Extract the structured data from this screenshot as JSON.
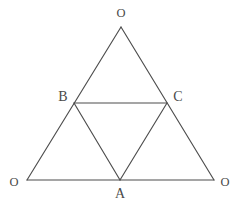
{
  "figure": {
    "background_color": "#ffffff",
    "line_color": "#4d4d4d",
    "label_color": "#4a4a4a",
    "width": 239,
    "height": 209,
    "points": {
      "O_top": {
        "label": "O",
        "x": 121,
        "y": 27,
        "label_x": 121,
        "label_y": 13,
        "size": "small"
      },
      "O_left": {
        "label": "O",
        "x": 27,
        "y": 180,
        "label_x": 14,
        "label_y": 182,
        "size": "small"
      },
      "O_right": {
        "label": "O",
        "x": 214,
        "y": 180,
        "label_x": 225,
        "label_y": 182,
        "size": "small"
      },
      "B": {
        "label": "B",
        "x": 74,
        "y": 103,
        "label_x": 63,
        "label_y": 97,
        "size": "cap"
      },
      "C": {
        "label": "C",
        "x": 167,
        "y": 103,
        "label_x": 178,
        "label_y": 97,
        "size": "cap"
      },
      "A": {
        "label": "A",
        "x": 120,
        "y": 180,
        "label_x": 120,
        "label_y": 194,
        "size": "cap"
      }
    },
    "segments": [
      {
        "name": "outer-left-edge",
        "from": "O_top",
        "to": "O_left"
      },
      {
        "name": "outer-right-edge",
        "from": "O_top",
        "to": "O_right"
      },
      {
        "name": "outer-bottom-edge",
        "from": "O_left",
        "to": "O_right"
      },
      {
        "name": "medial-bc",
        "from": "B",
        "to": "C"
      },
      {
        "name": "medial-ba",
        "from": "B",
        "to": "A"
      },
      {
        "name": "medial-ca",
        "from": "C",
        "to": "A"
      }
    ]
  }
}
